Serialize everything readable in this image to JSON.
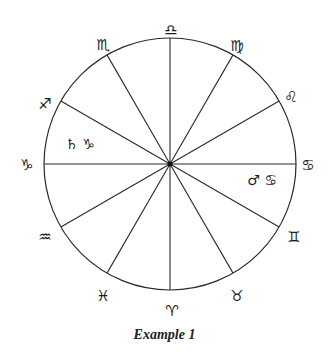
{
  "diagram": {
    "type": "zodiac-wheel",
    "center": [
      170,
      164
    ],
    "radius": 126,
    "line_color": "#2a2a2a",
    "spoke_angles_deg": [
      0,
      30,
      60,
      90,
      120,
      150,
      180,
      210,
      240,
      270,
      300,
      330
    ],
    "signs": [
      {
        "name": "libra",
        "glyph": "♎",
        "x": 171,
        "y": 30
      },
      {
        "name": "virgo",
        "glyph": "♍",
        "x": 237,
        "y": 46
      },
      {
        "name": "leo",
        "glyph": "♌",
        "x": 291,
        "y": 97
      },
      {
        "name": "cancer",
        "glyph": "♋",
        "x": 308,
        "y": 165
      },
      {
        "name": "gemini",
        "glyph": "♊",
        "x": 294,
        "y": 237
      },
      {
        "name": "taurus",
        "glyph": "♉",
        "x": 237,
        "y": 296
      },
      {
        "name": "aries",
        "glyph": "♈",
        "x": 172,
        "y": 311
      },
      {
        "name": "pisces",
        "glyph": "♓",
        "x": 103,
        "y": 296
      },
      {
        "name": "aquarius",
        "glyph": "♒",
        "x": 45,
        "y": 237
      },
      {
        "name": "capricorn",
        "glyph": "♑",
        "x": 27,
        "y": 165
      },
      {
        "name": "sagittarius",
        "glyph": "♐",
        "x": 45,
        "y": 104
      },
      {
        "name": "scorpio",
        "glyph": "♏",
        "x": 103,
        "y": 45
      }
    ],
    "placements": [
      {
        "name": "saturn-in-capricorn",
        "text": "♄ ♑",
        "x": 80,
        "y": 144
      },
      {
        "name": "mars-in-cancer",
        "text": "♂ ♋",
        "x": 262,
        "y": 180
      }
    ]
  },
  "caption": "Example 1"
}
